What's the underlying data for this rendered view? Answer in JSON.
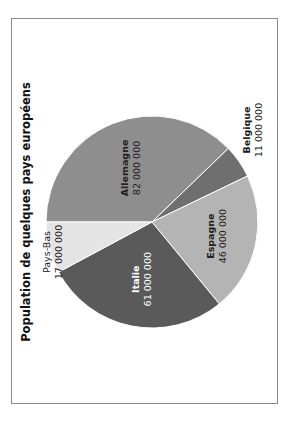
{
  "chart_data": {
    "type": "pie",
    "title": "Population de quelques pays européens",
    "orientation": "rotated 90° counter-clockwise",
    "slices": [
      {
        "label": "Allemagne",
        "value": 82000000,
        "value_text": "82 000 000",
        "color": "#8e8e8e",
        "label_style": "bold"
      },
      {
        "label": "Belgique",
        "value": 11000000,
        "value_text": "11 000 000",
        "color": "#6f6f6f",
        "label_style": "bold"
      },
      {
        "label": "Espagne",
        "value": 46000000,
        "value_text": "46 000 000",
        "color": "#b4b4b4",
        "label_style": "bold"
      },
      {
        "label": "Italie",
        "value": 61000000,
        "value_text": "61 000 000",
        "color": "#5a5a5a",
        "label_style": "bold-white"
      },
      {
        "label": "Pays-Bas",
        "value": 17000000,
        "value_text": "17 000 000",
        "color": "#e4e4e4",
        "label_style": "normal"
      }
    ]
  }
}
